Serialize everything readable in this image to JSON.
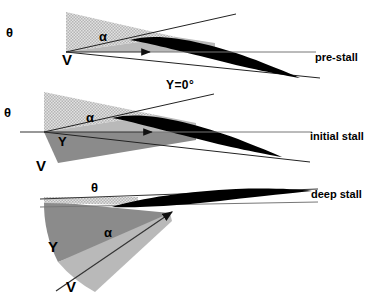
{
  "figure": {
    "background": "#ffffff",
    "ink": "#000000",
    "global_label": "Υ=0°",
    "colors": {
      "theta_wedge": "#cfcfcf",
      "alpha_wedge": "#b9b9b9",
      "gamma_wedge": "#8b8b8b",
      "airfoil": "#000000",
      "line": "#3a3a3a"
    }
  },
  "panels": [
    {
      "id": "pre-stall",
      "caption": "pre-stall",
      "labels": {
        "theta": "θ",
        "alpha": "α",
        "gamma": "Υ",
        "velocity": "V"
      },
      "shows_gamma_wedge": false,
      "angles_deg": {
        "theta": 13,
        "alpha": 13,
        "gamma": 0
      },
      "airfoil_incidence_deg": -13
    },
    {
      "id": "initial-stall",
      "caption": "initial stall",
      "labels": {
        "theta": "θ",
        "alpha": "α",
        "gamma": "Υ",
        "velocity": "V"
      },
      "shows_gamma_wedge": true,
      "angles_deg": {
        "theta": 13,
        "alpha": 13,
        "gamma": 10
      },
      "airfoil_incidence_deg": -13
    },
    {
      "id": "deep-stall",
      "caption": "deep stall",
      "labels": {
        "theta": "θ",
        "alpha": "α",
        "gamma": "Υ",
        "velocity": "V"
      },
      "shows_gamma_wedge": true,
      "angles_deg": {
        "theta": 4,
        "alpha": 26,
        "gamma": 26
      },
      "airfoil_incidence_deg": -3
    }
  ]
}
